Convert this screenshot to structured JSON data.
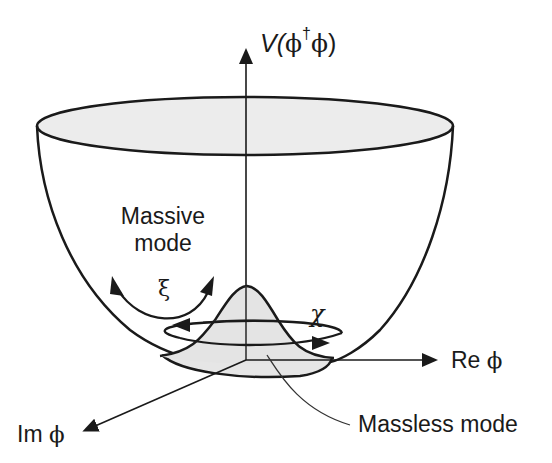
{
  "diagram": {
    "axes": {
      "vertical": {
        "label_prefix": "V(",
        "label_phi1": "ϕ",
        "label_dagger": "†",
        "label_phi2": "ϕ",
        "label_suffix": ")"
      },
      "real": {
        "label_text": "Re ",
        "label_symbol": "ϕ"
      },
      "imaginary": {
        "label_text": "Im ",
        "label_symbol": "ϕ"
      }
    },
    "annotations": {
      "massive_mode_line1": "Massive",
      "massive_mode_line2": "mode",
      "xi_symbol": "ξ",
      "chi_symbol": "χ",
      "massless_mode": "Massless mode"
    },
    "colors": {
      "stroke": "#1a1a1a",
      "fill_light": "#ececec",
      "fill_hump": "#e4e4e4",
      "background": "#ffffff"
    }
  }
}
